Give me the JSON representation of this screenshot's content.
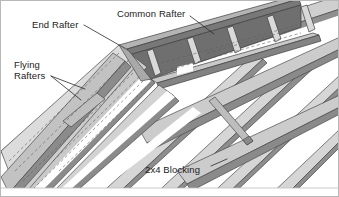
{
  "figure": {
    "kind": "technical-illustration",
    "style": "grayscale axonometric line drawing with hidden dashed lines",
    "background_color": "#ffffff",
    "border_color": "#b8b8b8",
    "ink_color": "#1b1b1b"
  },
  "labels": {
    "end_rafter": "End Rafter",
    "common_rafter": "Common Rafter",
    "flying_rafters_line1": "Flying",
    "flying_rafters_line2": "Rafters",
    "blocking": "2x4 Blocking"
  },
  "palette": {
    "face_light": "#e3e3e3",
    "face_mid": "#c7c7c7",
    "face_dark": "#9a9a9a",
    "face_darker": "#7d7d7d",
    "face_shadow": "#636363",
    "edge": "#4a4a4a",
    "hidden_line": "#6b6b6b",
    "white": "#ffffff"
  }
}
